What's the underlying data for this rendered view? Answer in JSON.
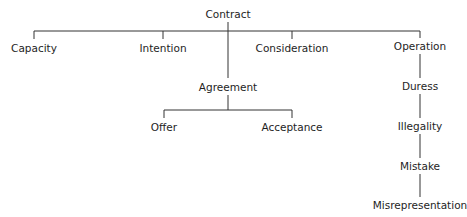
{
  "diagram": {
    "type": "tree",
    "root": "Contract",
    "nodes": {
      "contract": {
        "label": "Contract",
        "x": 228,
        "y": 14
      },
      "capacity": {
        "label": "Capacity",
        "x": 34,
        "y": 48
      },
      "intention": {
        "label": "Intention",
        "x": 163,
        "y": 48
      },
      "consideration": {
        "label": "Consideration",
        "x": 292,
        "y": 48
      },
      "operation": {
        "label": "Operation",
        "x": 420,
        "y": 46
      },
      "agreement": {
        "label": "Agreement",
        "x": 228,
        "y": 87
      },
      "offer": {
        "label": "Offer",
        "x": 164,
        "y": 127
      },
      "acceptance": {
        "label": "Acceptance",
        "x": 292,
        "y": 127
      },
      "duress": {
        "label": "Duress",
        "x": 420,
        "y": 86
      },
      "illegality": {
        "label": "Illegality",
        "x": 420,
        "y": 126
      },
      "mistake": {
        "label": "Mistake",
        "x": 420,
        "y": 166
      },
      "misrepresentation": {
        "label": "Misrepresentation",
        "x": 420,
        "y": 205
      }
    },
    "edges": [
      [
        "contract",
        "capacity"
      ],
      [
        "contract",
        "intention"
      ],
      [
        "contract",
        "consideration"
      ],
      [
        "contract",
        "operation"
      ],
      [
        "contract",
        "agreement"
      ],
      [
        "agreement",
        "offer"
      ],
      [
        "agreement",
        "acceptance"
      ],
      [
        "operation",
        "duress"
      ],
      [
        "duress",
        "illegality"
      ],
      [
        "illegality",
        "mistake"
      ],
      [
        "mistake",
        "misrepresentation"
      ]
    ]
  }
}
